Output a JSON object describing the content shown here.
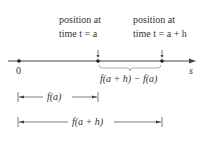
{
  "diagram": {
    "labels": {
      "pos_a_line1": "position at",
      "pos_a_line2": "time t = a",
      "pos_ah_line1": "position at",
      "pos_ah_line2": "time t = a + h",
      "origin": "0",
      "axis": "s",
      "difference": "f(a + h) − f(a)",
      "fa": "f(a)",
      "fah": "f(a + h)"
    },
    "colors": {
      "line": "#333333",
      "brace": "#999999"
    }
  }
}
